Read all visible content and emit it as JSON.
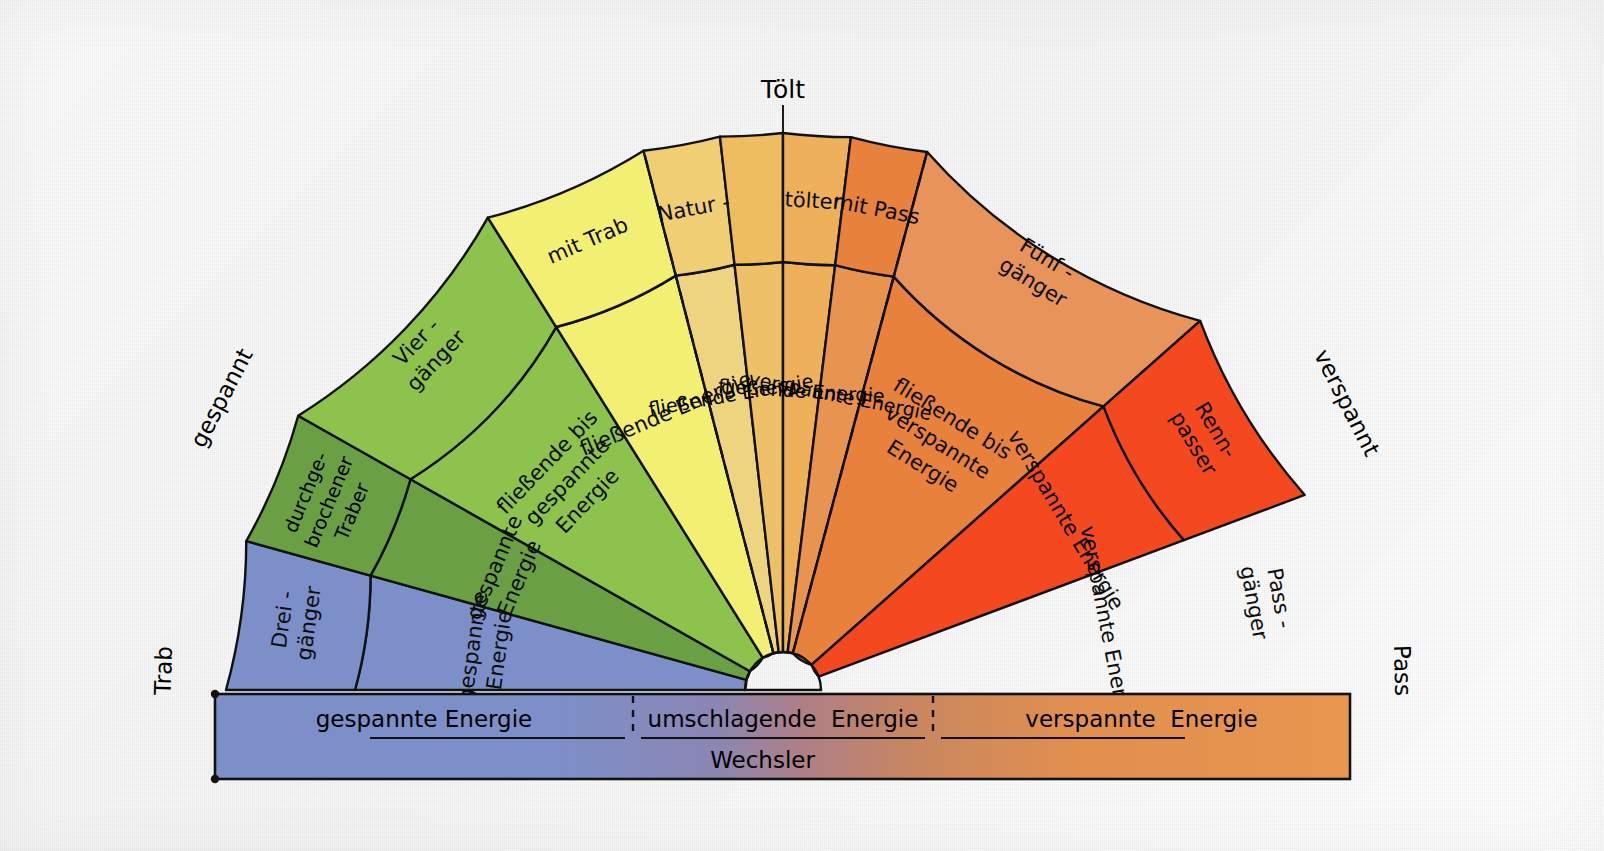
{
  "title_top": "Tölt",
  "axis_labels": {
    "left": "Trab",
    "right": "Pass",
    "left_upper": "gespannt",
    "right_upper": "verspannt"
  },
  "outer_ring": [
    {
      "id": "drei-gaenger",
      "label_lines": [
        "Drei -",
        "gänger"
      ],
      "color": "#7d8fc8"
    },
    {
      "id": "durchgebrochener-traber",
      "label_lines": [
        "durchge-",
        "brochener",
        "Traber"
      ],
      "color": "#6a9f44"
    },
    {
      "id": "vier-gaenger",
      "label_lines": [
        "Vier -",
        "gänger"
      ],
      "color": "#8dc24c"
    },
    {
      "id": "mit-trab",
      "label_lines": [
        "mit Trab"
      ],
      "color": "#f3ef72"
    },
    {
      "id": "natur-toelter-1",
      "label_lines": [
        "Natur -"
      ],
      "color": "#efce74"
    },
    {
      "id": "natur-toelter-2",
      "label_lines": [
        "tölter"
      ],
      "color": "#eebd5f"
    },
    {
      "id": "mit-pass",
      "label_lines": [
        "mit Pass"
      ],
      "color": "#eeb05a"
    },
    {
      "id": "fuenf-gaenger",
      "label_lines": [
        "Fünf -",
        "gänger"
      ],
      "color": "#e8813c"
    },
    {
      "id": "renn-passer",
      "label_lines": [
        "Renn-",
        "passer"
      ],
      "color": "#e8935a"
    },
    {
      "id": "pass-gaenger",
      "label_lines": [
        "Pass -",
        "gänger"
      ],
      "color": "#f4481e"
    }
  ],
  "inner_sectors": [
    {
      "id": "inner-drei-gaenger",
      "label_lines": [
        "gespannte",
        "Energie"
      ],
      "color": "#7d8fc8"
    },
    {
      "id": "inner-durchgebrochener",
      "label_lines": [
        "gespannte",
        "Energie"
      ],
      "color": "#6a9f44"
    },
    {
      "id": "inner-vier-gaenger",
      "label_lines": [
        "fließende bis",
        "gespannte",
        "Energie"
      ],
      "color": "#8dc24c"
    },
    {
      "id": "inner-mit-trab",
      "label_lines": [
        "fließende Energie"
      ],
      "color": "#f3ef72"
    },
    {
      "id": "inner-natur-1",
      "label_lines": [
        "fließende Energie"
      ],
      "color": "#efd47f"
    },
    {
      "id": "inner-natur-2",
      "label_lines": [
        "fließende Energie"
      ],
      "color": "#eec068"
    },
    {
      "id": "inner-mit-pass",
      "label_lines": [
        "verspannte Energie"
      ],
      "color": "#eeb05a"
    },
    {
      "id": "inner-fuenf-gaenger",
      "label_lines": [
        "fließende bis",
        "verspannte",
        "Energie"
      ],
      "color": "#e8934f"
    },
    {
      "id": "inner-renn-passer",
      "label_lines": [
        "verspannte Energie"
      ],
      "color": "#e8813c"
    },
    {
      "id": "inner-pass-gaenger",
      "label_lines": [
        "verspannte Energie"
      ],
      "color": "#f4481e"
    }
  ],
  "bottom_bar": {
    "segments": [
      "gespannte Energie",
      "umschlagende  Energie",
      "verspannte  Energie"
    ],
    "separator": "¦",
    "wechsler_label": "Wechsler"
  },
  "colors": {
    "trab_blue": "#7d8fc8",
    "dark_green": "#6a9f44",
    "green": "#8dc24c",
    "yellow": "#f3ef72",
    "sand": "#efce74",
    "amber": "#eeb05a",
    "orange": "#e8813c",
    "light_orange": "#e8935a",
    "red_orange": "#f4481e",
    "outline": "#111111",
    "paper": "#fbfbfb"
  }
}
